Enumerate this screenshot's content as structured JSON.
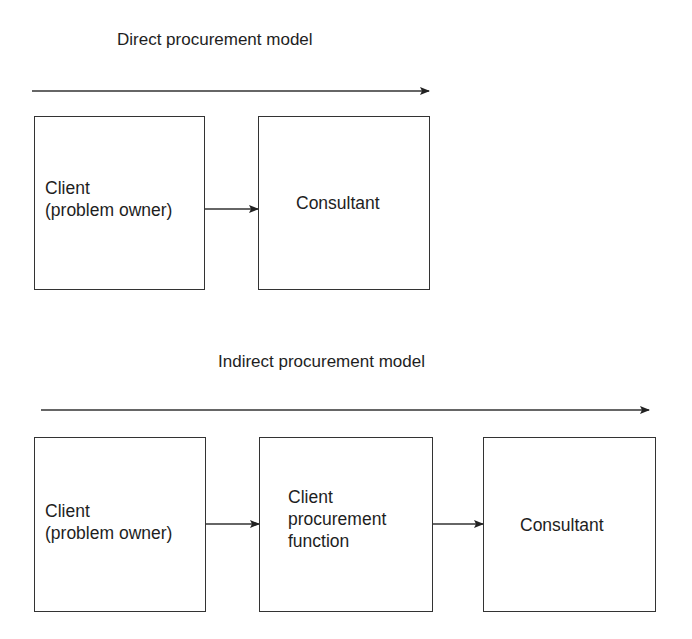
{
  "diagrams": [
    {
      "title": "Direct procurement model",
      "nodes": [
        {
          "lines": [
            "Client",
            "(problem owner)"
          ]
        },
        {
          "lines": [
            "Consultant"
          ]
        }
      ],
      "edges": [
        {
          "from": 0,
          "to": 1
        }
      ]
    },
    {
      "title": "Indirect procurement model",
      "nodes": [
        {
          "lines": [
            "Client",
            "(problem owner)"
          ]
        },
        {
          "lines": [
            "Client",
            "procurement",
            "function"
          ]
        },
        {
          "lines": [
            "Consultant"
          ]
        }
      ],
      "edges": [
        {
          "from": 0,
          "to": 1
        },
        {
          "from": 1,
          "to": 2
        }
      ]
    }
  ],
  "colors": {
    "stroke": "#333333",
    "text": "#1e1e1e",
    "background": "#ffffff"
  }
}
